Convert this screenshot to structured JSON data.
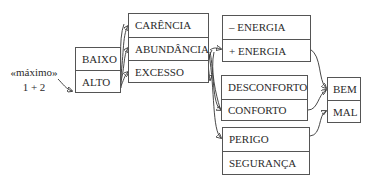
{
  "input_label": {
    "line1": "«máximo»",
    "line2": "1 + 2"
  },
  "level_box": {
    "items": [
      "BAIXO",
      "ALTO"
    ]
  },
  "quantity_box": {
    "items": [
      "CARÊNCIA",
      "ABUNDÂNCIA",
      "EXCESSO"
    ]
  },
  "energy_box": {
    "items": [
      "– ENERGIA",
      "+ ENERGIA"
    ]
  },
  "comfort_box": {
    "items": [
      "DESCONFORTO",
      "CONFORTO"
    ]
  },
  "safety_box": {
    "items": [
      "PERIGO",
      "SEGURANÇA"
    ]
  },
  "value_box": {
    "items": [
      "BEM",
      "MAL"
    ]
  },
  "colors": {
    "line": "#333333",
    "border": "#555555",
    "text": "#2b2b2b",
    "background": "#ffffff"
  }
}
